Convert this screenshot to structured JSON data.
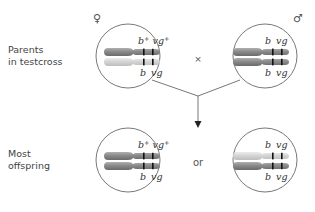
{
  "labels": {
    "parents": [
      "Parents",
      "in testcross"
    ],
    "offspring": [
      "Most",
      "offspring"
    ],
    "cross_symbol": "×",
    "or_text": "or",
    "female_symbol": "♀",
    "male_symbol": "♂"
  },
  "colors": {
    "dark_chromosome": "#8c8c8c",
    "light_chromosome": "#d6d6d6",
    "band": "#111111",
    "circle_stroke": "#555555",
    "line": "#555555"
  },
  "cells": [
    {
      "id": "female-parent",
      "position": "top-left",
      "top_label": {
        "b": "b",
        "b_sup": "+",
        "vg": "vg",
        "vg_sup": "+"
      },
      "bottom_label": {
        "b": "b",
        "vg": "vg"
      },
      "chromosomes": [
        "dark",
        "light"
      ]
    },
    {
      "id": "male-parent",
      "position": "top-right",
      "top_label": {
        "b": "b",
        "vg": "vg"
      },
      "bottom_label": {
        "b": "b",
        "vg": "vg"
      },
      "chromosomes": [
        "dark",
        "dark"
      ]
    },
    {
      "id": "offspring-wildtype",
      "position": "bottom-left",
      "top_label": {
        "b": "b",
        "b_sup": "+",
        "vg": "vg",
        "vg_sup": "+"
      },
      "bottom_label": {
        "b": "b",
        "vg": "vg"
      },
      "chromosomes": [
        "dark",
        "dark"
      ]
    },
    {
      "id": "offspring-mutant",
      "position": "bottom-right",
      "top_label": {
        "b": "b",
        "vg": "vg"
      },
      "bottom_label": {
        "b": "b",
        "vg": "vg"
      },
      "chromosomes": [
        "light",
        "dark"
      ]
    }
  ]
}
